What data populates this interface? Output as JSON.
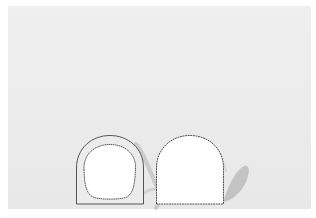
{
  "canvas": {
    "width": 316,
    "height": 218,
    "page_bg": "#ffffff"
  },
  "panel": {
    "bg": "#ececec"
  },
  "colors": {
    "outline": "#555555",
    "fill_white": "#ffffff",
    "wall_fill": "#ececec",
    "shadow": "#b9b9b9"
  },
  "shapes": [
    {
      "name": "left-arch-with-inner-opening",
      "type": "arch-ring"
    },
    {
      "name": "right-solid-arch",
      "type": "arch"
    }
  ]
}
